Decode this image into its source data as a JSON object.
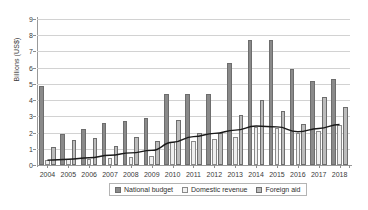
{
  "chart_data": {
    "type": "bar",
    "title": "",
    "xlabel": "",
    "ylabel": "Billions (US$)",
    "ylim": [
      0,
      9
    ],
    "ytick_labels": [
      "0",
      "1",
      "2",
      "3",
      "4",
      "5",
      "6",
      "7",
      "8",
      "9"
    ],
    "grid": true,
    "legend_position": "bottom",
    "categories": [
      "2004",
      "2005",
      "2006",
      "2007",
      "2008",
      "2009",
      "2010",
      "2011",
      "2012",
      "2013",
      "2014",
      "2015",
      "2016",
      "2017",
      "2018"
    ],
    "series": [
      {
        "name": "National budget",
        "color": "#8a8a8a",
        "values": [
          4.85,
          1.9,
          2.2,
          2.6,
          2.7,
          2.9,
          4.35,
          4.4,
          4.4,
          6.3,
          7.7,
          7.7,
          5.9,
          5.2,
          5.3
        ]
      },
      {
        "name": "Domestic revenue",
        "color": "#efefef",
        "values": [
          0.3,
          0.35,
          0.4,
          0.45,
          0.5,
          0.55,
          1.4,
          1.5,
          1.6,
          1.75,
          2.35,
          2.3,
          2.0,
          2.1,
          2.45
        ]
      },
      {
        "name": "Foreign aid",
        "color": "#bcbcbc",
        "values": [
          1.1,
          1.55,
          1.65,
          1.15,
          1.7,
          1.5,
          2.8,
          2.0,
          2.0,
          3.1,
          4.0,
          3.3,
          2.55,
          4.2,
          3.6
        ]
      }
    ],
    "trend_line": {
      "name": "Domestic revenue trend",
      "color": "#1a1a1a",
      "values": [
        0.3,
        0.35,
        0.45,
        0.6,
        0.75,
        0.9,
        1.4,
        1.75,
        1.95,
        2.15,
        2.4,
        2.35,
        2.05,
        2.25,
        2.5
      ]
    }
  },
  "legend": {
    "items": [
      {
        "label": "National budget"
      },
      {
        "label": "Domestic revenue"
      },
      {
        "label": "Foreign aid"
      }
    ]
  }
}
